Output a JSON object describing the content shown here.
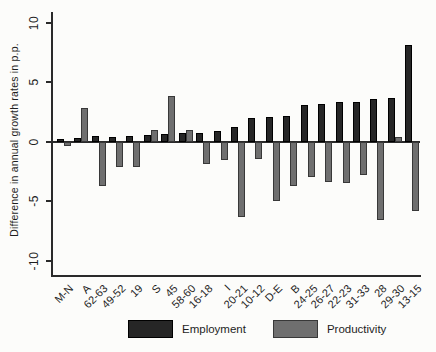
{
  "chart_data": {
    "type": "bar",
    "title": "",
    "xlabel": "",
    "ylabel": "Difference in annual growth rates in p.p.",
    "ylim": [
      -10,
      10
    ],
    "yticks": [
      10,
      5,
      0,
      -5,
      -10
    ],
    "grid": false,
    "legend_position": "bottom",
    "categories": [
      "M-N",
      "A",
      "62-63",
      "49-52",
      "19",
      "S",
      "45",
      "58-60",
      "16-18",
      "I",
      "20-21",
      "10-12",
      "D-E",
      "B",
      "24-25",
      "26-27",
      "22-23",
      "31-33",
      "28",
      "29-30",
      "13-15"
    ],
    "series": [
      {
        "name": "Employment",
        "color": "#262626",
        "border_color": "#000000",
        "values": [
          0.2,
          0.35,
          0.45,
          0.4,
          0.45,
          0.6,
          0.65,
          0.7,
          0.75,
          0.9,
          1.2,
          2.0,
          2.1,
          2.2,
          3.05,
          3.2,
          3.3,
          3.35,
          3.6,
          3.7,
          8.1
        ]
      },
      {
        "name": "Productivity",
        "color": "#6f6f6f",
        "border_color": "#383838",
        "values": [
          -0.35,
          2.8,
          -3.7,
          -2.1,
          -2.1,
          1.0,
          3.85,
          0.95,
          -1.9,
          -1.5,
          -6.3,
          -1.45,
          -5.0,
          -3.7,
          -2.95,
          -3.4,
          -3.5,
          -2.8,
          -6.6,
          0.4,
          -5.8
        ]
      }
    ]
  },
  "colors": {
    "axis": "#2a2a2a",
    "text": "#1e1e1e",
    "background": "#fcfcfa"
  }
}
